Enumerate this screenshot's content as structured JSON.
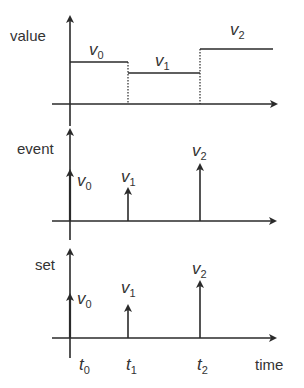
{
  "panels": {
    "value": {
      "axis_label": "value",
      "values": [
        {
          "base": "v",
          "sub": "0"
        },
        {
          "base": "v",
          "sub": "1"
        },
        {
          "base": "v",
          "sub": "2"
        }
      ]
    },
    "event": {
      "axis_label": "event",
      "values": [
        {
          "base": "v",
          "sub": "0"
        },
        {
          "base": "v",
          "sub": "1"
        },
        {
          "base": "v",
          "sub": "2"
        }
      ]
    },
    "set": {
      "axis_label": "set",
      "values": [
        {
          "base": "v",
          "sub": "0"
        },
        {
          "base": "v",
          "sub": "1"
        },
        {
          "base": "v",
          "sub": "2"
        }
      ]
    }
  },
  "time_axis": {
    "label": "time",
    "ticks": [
      {
        "base": "t",
        "sub": "0"
      },
      {
        "base": "t",
        "sub": "1"
      },
      {
        "base": "t",
        "sub": "2"
      }
    ]
  },
  "colors": {
    "line": "#2a2a2a",
    "text": "#333333"
  }
}
